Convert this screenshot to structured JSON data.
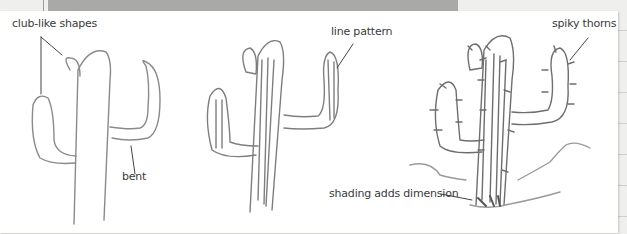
{
  "illustration": {
    "subject": "Cactus drawing steps",
    "labels": {
      "club_like_shapes": "club-like shapes",
      "bent": "bent",
      "line_pattern": "line pattern",
      "spiky_thorns": "spiky thorns",
      "shading": "shading adds dimension"
    },
    "colors": {
      "paper": "#ffffff",
      "pencil": "#7a7a7a",
      "background": "#efefed",
      "band": "#a9a9a7"
    }
  }
}
